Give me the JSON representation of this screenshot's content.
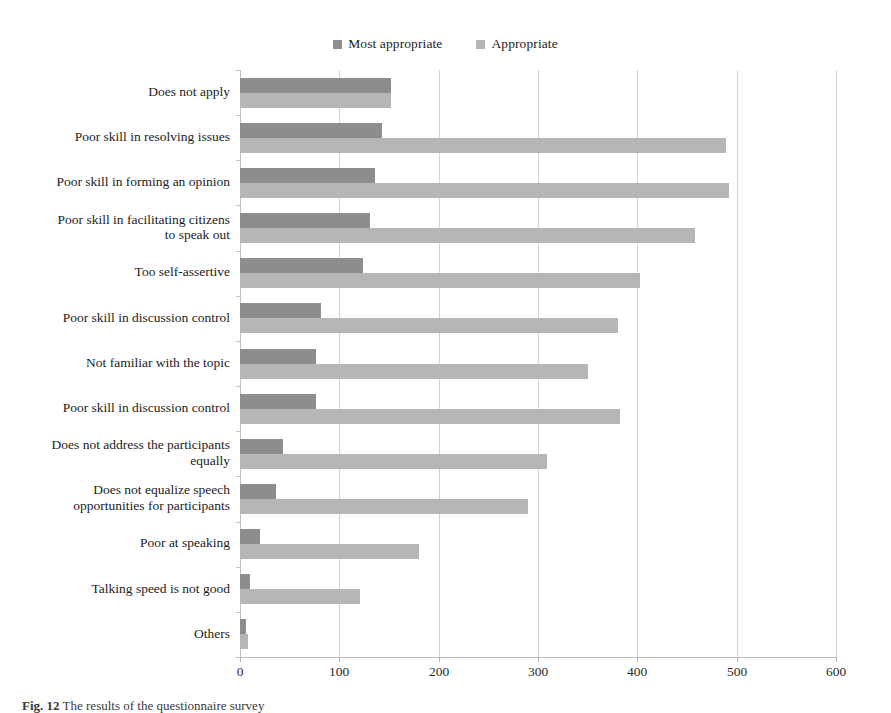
{
  "chart_data": {
    "type": "bar",
    "orientation": "horizontal",
    "title": "",
    "xlabel": "",
    "ylabel": "",
    "xlim": [
      0,
      600
    ],
    "xticks": [
      0,
      100,
      200,
      300,
      400,
      500,
      600
    ],
    "grid": true,
    "legend_position": "top-center",
    "categories": [
      "Does not apply",
      "Poor skill in resolving  issues",
      "Poor skill in forming an opinion",
      "Poor skill in facilitating citizens\nto speak out",
      "Too self-assertive",
      "Poor skill in discussion control",
      "Not familiar with the topic",
      "Poor skill in discussion control",
      "Does not address the participants\nequally",
      "Does not equalize  speech\nopportunities for participants",
      "Poor at speaking",
      "Talking speed is not good",
      "Others"
    ],
    "series": [
      {
        "name": "Most appropriate",
        "color": "#8d8d8d",
        "values": [
          152,
          143,
          136,
          131,
          124,
          82,
          77,
          77,
          43,
          36,
          20,
          10,
          6
        ]
      },
      {
        "name": "Appropriate",
        "color": "#b6b6b6",
        "values": [
          152,
          489,
          492,
          458,
          403,
          381,
          350,
          383,
          309,
          290,
          180,
          121,
          8
        ]
      }
    ]
  },
  "legend": {
    "items": [
      {
        "label": "Most appropriate",
        "color": "#8d8d8d"
      },
      {
        "label": "Appropriate",
        "color": "#b6b6b6"
      }
    ]
  },
  "axis": {
    "x_tick_labels": [
      "0",
      "100",
      "200",
      "300",
      "400",
      "500",
      "600"
    ]
  },
  "caption": {
    "figure_number": "Fig. 12",
    "text": "The results of the questionnaire survey"
  },
  "colors": {
    "most_appropriate": "#8d8d8d",
    "appropriate": "#b6b6b6",
    "gridline": "#d3d3d3",
    "axis": "#bdbdbd",
    "text": "#1c1c1c",
    "background": "#ffffff"
  }
}
